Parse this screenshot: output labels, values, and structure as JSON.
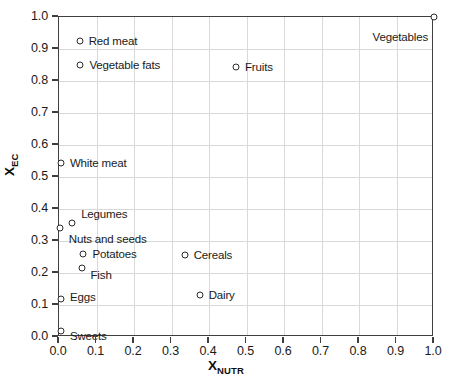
{
  "chart_data": {
    "type": "scatter",
    "title": "",
    "xlabel": "X_NUTR",
    "ylabel": "X_EC",
    "xlabel_base": "X",
    "xlabel_sub": "NUTR",
    "ylabel_base": "X",
    "ylabel_sub": "EC",
    "xlim": [
      0.0,
      1.0
    ],
    "ylim": [
      0.0,
      1.0
    ],
    "grid": true,
    "legend": "none (points labeled directly)",
    "xticks": [
      "0.0",
      "0.1",
      "0.2",
      "0.3",
      "0.4",
      "0.5",
      "0.6",
      "0.7",
      "0.8",
      "0.9",
      "1.0"
    ],
    "yticks": [
      "0.0",
      "0.1",
      "0.2",
      "0.3",
      "0.4",
      "0.5",
      "0.6",
      "0.7",
      "0.8",
      "0.9",
      "1.0"
    ],
    "xtick_values": [
      0.0,
      0.1,
      0.2,
      0.3,
      0.4,
      0.5,
      0.6,
      0.7,
      0.8,
      0.9,
      1.0
    ],
    "ytick_values": [
      0.0,
      0.1,
      0.2,
      0.3,
      0.4,
      0.5,
      0.6,
      0.7,
      0.8,
      0.9,
      1.0
    ],
    "marker_style": "open-circle",
    "marker_color": "#2b2b2b",
    "grid_color": "#d9d9d9",
    "axis_color": "#3f3f3f",
    "points": [
      {
        "label": "Vegetables",
        "x": 1.0,
        "y": 1.0,
        "label_side": "left",
        "label_dx": -6,
        "label_dy": 20
      },
      {
        "label": "Red meat",
        "x": 0.055,
        "y": 0.925,
        "label_side": "right",
        "label_dx": 9,
        "label_dy": 0
      },
      {
        "label": "Vegetable fats",
        "x": 0.057,
        "y": 0.85,
        "label_side": "right",
        "label_dx": 9,
        "label_dy": 0
      },
      {
        "label": "Fruits",
        "x": 0.472,
        "y": 0.845,
        "label_side": "right",
        "label_dx": 9,
        "label_dy": 0
      },
      {
        "label": "White meat",
        "x": 0.005,
        "y": 0.545,
        "label_side": "right",
        "label_dx": 9,
        "label_dy": 0
      },
      {
        "label": "Legumes",
        "x": 0.035,
        "y": 0.355,
        "label_side": "right",
        "label_dx": 9,
        "label_dy": -9
      },
      {
        "label": "Nuts and seeds",
        "x": 0.002,
        "y": 0.34,
        "label_side": "right",
        "label_dx": 9,
        "label_dy": 11
      },
      {
        "label": "Potatoes",
        "x": 0.065,
        "y": 0.26,
        "label_side": "right",
        "label_dx": 9,
        "label_dy": 0
      },
      {
        "label": "Cereals",
        "x": 0.335,
        "y": 0.255,
        "label_side": "right",
        "label_dx": 9,
        "label_dy": 0
      },
      {
        "label": "Fish",
        "x": 0.06,
        "y": 0.215,
        "label_side": "right",
        "label_dx": 9,
        "label_dy": 7
      },
      {
        "label": "Dairy",
        "x": 0.375,
        "y": 0.13,
        "label_side": "right",
        "label_dx": 9,
        "label_dy": 0
      },
      {
        "label": "Eggs",
        "x": 0.005,
        "y": 0.12,
        "label_side": "right",
        "label_dx": 9,
        "label_dy": -2
      },
      {
        "label": "Sweets",
        "x": 0.005,
        "y": 0.02,
        "label_side": "right",
        "label_dx": 9,
        "label_dy": 5
      }
    ]
  }
}
